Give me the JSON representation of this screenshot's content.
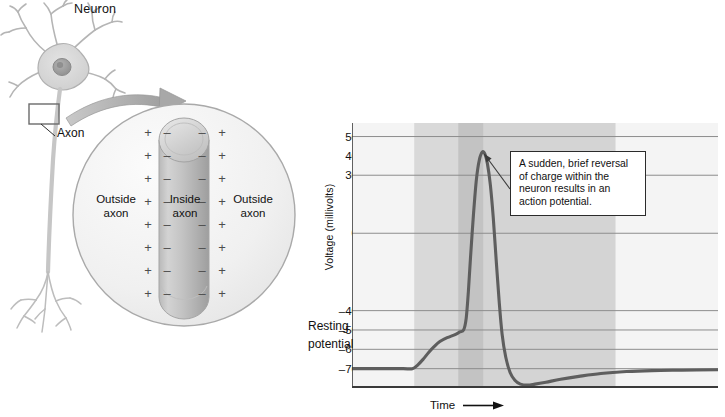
{
  "illustration": {
    "neuron_title": "Neuron",
    "axon_label": "Axon",
    "cross_section": {
      "outside_left_line1": "Outside",
      "outside_left_line2": "axon",
      "inside_line1": "Inside",
      "inside_line2": "axon",
      "outside_right_line1": "Outside",
      "outside_right_line2": "axon",
      "outside_charge_symbol": "+",
      "inside_charge_symbol": "–"
    }
  },
  "chart_panel": {
    "callout": {
      "line1": "A sudden, brief reversal",
      "line2": "of charge within the",
      "line3": "neuron results in an",
      "line4": "action potential."
    },
    "resting_label_line1": "Resting",
    "resting_label_line2": "potential",
    "x_axis_label": "Time"
  },
  "chart_data": {
    "type": "line",
    "title": "",
    "xlabel": "Time",
    "ylabel": "Voltage (millivolts)",
    "ylim": [
      -80,
      57
    ],
    "xlim": [
      0,
      100
    ],
    "grid": true,
    "legend": false,
    "ytick_labels": [
      "50",
      "40",
      "30",
      "0",
      "–40",
      "–50",
      "–60",
      "–70"
    ],
    "ytick_values": [
      50,
      40,
      30,
      0,
      -40,
      -50,
      -60,
      -70
    ],
    "gridline_values": [
      50,
      30,
      0,
      -40,
      -50,
      -60,
      -70
    ],
    "xtick_labels": [],
    "accent_color": "#6f6f6f",
    "line_color": "#5e5e5e",
    "grid_color": "#8d8d8d",
    "axis_color": "#3a3a3a",
    "bands": [
      {
        "name": "depolarization-band",
        "x0": 17,
        "x1": 29,
        "color": "#d9d9d9"
      },
      {
        "name": "action-potential-band",
        "x0": 29,
        "x1": 36,
        "color": "#c3c3c3"
      },
      {
        "name": "refractory-band",
        "x0": 36,
        "x1": 72,
        "color": "#d4d4d4"
      }
    ],
    "series": [
      {
        "name": "membrane-potential",
        "points": [
          [
            0,
            -70
          ],
          [
            4,
            -70
          ],
          [
            9,
            -70
          ],
          [
            14,
            -70
          ],
          [
            16.5,
            -70
          ],
          [
            18,
            -68
          ],
          [
            19.5,
            -65
          ],
          [
            21,
            -61.5
          ],
          [
            22.5,
            -58.5
          ],
          [
            24,
            -56
          ],
          [
            26,
            -54
          ],
          [
            28,
            -52.5
          ],
          [
            29.5,
            -51
          ],
          [
            30.5,
            -50
          ],
          [
            31.2,
            -44
          ],
          [
            31.8,
            -30
          ],
          [
            32.4,
            -12
          ],
          [
            33.2,
            10
          ],
          [
            34.0,
            28
          ],
          [
            34.8,
            38
          ],
          [
            35.6,
            42
          ],
          [
            36.3,
            41
          ],
          [
            37.0,
            36
          ],
          [
            37.8,
            25
          ],
          [
            38.6,
            8
          ],
          [
            39.4,
            -14
          ],
          [
            40.2,
            -35
          ],
          [
            41.0,
            -52
          ],
          [
            42.0,
            -64
          ],
          [
            43.2,
            -72
          ],
          [
            44.5,
            -76
          ],
          [
            46,
            -78
          ],
          [
            48,
            -78.5
          ],
          [
            50,
            -78
          ],
          [
            53,
            -77
          ],
          [
            57,
            -75.5
          ],
          [
            62,
            -74
          ],
          [
            68,
            -72.5
          ],
          [
            75,
            -71.5
          ],
          [
            82,
            -71
          ],
          [
            90,
            -70.8
          ],
          [
            100,
            -70.6
          ]
        ]
      }
    ],
    "annotations": [
      {
        "name": "action-potential-callout",
        "text": "A sudden, brief reversal of charge within the neuron results in an action potential.",
        "target_x": 35.6,
        "target_y": 42
      }
    ]
  }
}
